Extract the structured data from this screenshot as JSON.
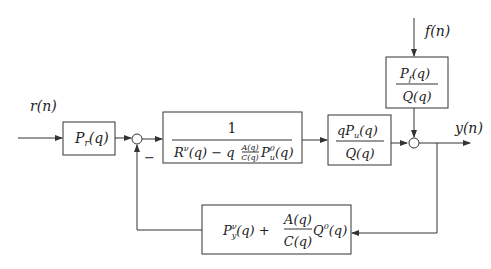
{
  "diagram": {
    "type": "block-diagram",
    "signals": {
      "input": "r(n)",
      "disturbance": "f(n)",
      "output": "y(n)"
    },
    "blocks": {
      "prefilter": {
        "label": "P_r(q)",
        "parts": {
          "main": "P",
          "sub": "r",
          "arg": "(q)"
        }
      },
      "controller": {
        "numerator": "1",
        "denominator": "R^v(q) − q A(q)/C(q) P_u^0(q)",
        "parts": {
          "r": "R",
          "r_sup": "ν",
          "r_arg": "(q) − q",
          "frac_num": "A(q)",
          "frac_den": "C(q)",
          "p": "P",
          "p_sup": "0",
          "p_sub": "u",
          "p_arg": "(q)"
        }
      },
      "plant": {
        "numerator": "qP_u(q)",
        "denominator": "Q(q)",
        "parts": {
          "num_q": "qP",
          "num_sub": "u",
          "num_arg": "(q)",
          "den": "Q(q)"
        }
      },
      "disturbance_filter": {
        "numerator": "P_f(q)",
        "denominator": "Q(q)",
        "parts": {
          "num_p": "P",
          "num_sub": "f",
          "num_arg": "(q)",
          "den": "Q(q)"
        }
      },
      "feedback": {
        "label": "P_y^v(q) + A(q)/C(q) Q^0(q)",
        "parts": {
          "p": "P",
          "p_sup": "ν",
          "p_sub": "y",
          "p_arg": "(q) +",
          "frac_num": "A(q)",
          "frac_den": "C(q)",
          "q": "Q",
          "q_sup": "0",
          "q_arg": "(q)"
        }
      }
    },
    "junctions": {
      "left": {
        "sign": "−"
      },
      "right": {
        "sign": ""
      }
    }
  }
}
